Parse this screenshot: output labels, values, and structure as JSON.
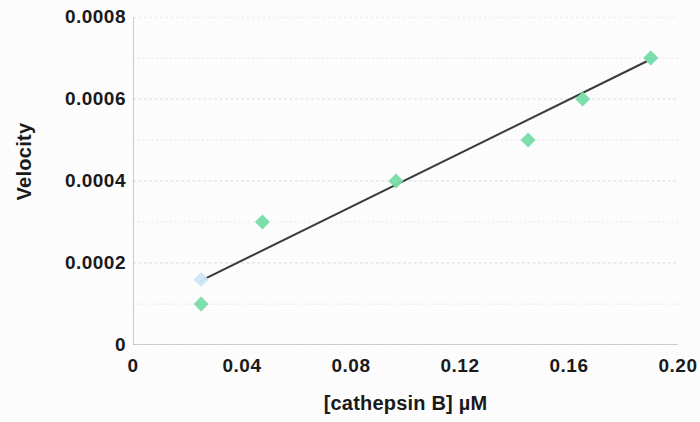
{
  "chart_data": {
    "type": "scatter",
    "title": "",
    "xlabel": "[cathepsin B] µM",
    "ylabel": "Velocity",
    "xlim": [
      0,
      0.2
    ],
    "ylim": [
      0,
      0.0008
    ],
    "xticks": [
      "0",
      "0.04",
      "0.08",
      "0.12",
      "0.16",
      "0.20"
    ],
    "xtick_values": [
      0,
      0.04,
      0.08,
      0.12,
      0.16,
      0.2
    ],
    "yticks": [
      "0",
      "0.0002",
      "0.0004",
      "0.0006",
      "0.0008"
    ],
    "ytick_values": [
      0,
      0.0002,
      0.0004,
      0.0006,
      0.0008
    ],
    "y_minor_step": 0.0001,
    "grid": "horizontal-dashed",
    "legend": "none",
    "series": [
      {
        "name": "data",
        "marker": "diamond",
        "color": "#77dda8",
        "x": [
          0.025,
          0.0475,
          0.0965,
          0.145,
          0.165,
          0.19
        ],
        "y": [
          0.0001,
          0.0003,
          0.0004,
          0.0005,
          0.0006,
          0.0007
        ]
      },
      {
        "name": "overlay",
        "marker": "diamond",
        "color": "#cfe8f5",
        "x": [
          0.025,
          0.19
        ],
        "y": [
          0.00016,
          0.0007
        ]
      }
    ],
    "trendline": {
      "name": "linear fit",
      "color": "#3b3b3b",
      "x": [
        0.025,
        0.191
      ],
      "y": [
        0.000157,
        0.0007
      ]
    }
  },
  "axes": {
    "y_title": "Velocity",
    "x_title": "[cathepsin B] µM"
  },
  "colors": {
    "marker_green": "#77dda8",
    "marker_blue": "#cfe8f5",
    "trendline": "#3b3b3b",
    "gridline": "#c9d6e4",
    "axis": "#9aa6b2",
    "text": "#1a1a1a"
  }
}
